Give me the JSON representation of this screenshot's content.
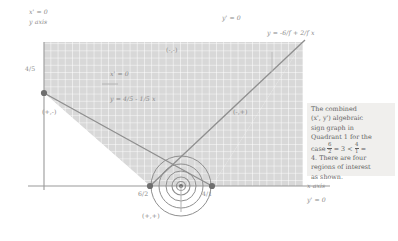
{
  "figure": {
    "type": "sign-graph",
    "description": "Algebraic sign graph in Quadrant 1",
    "axes": {
      "y_axis_label": "y axis",
      "x_axis_label": "x axis",
      "x_prime_zero": "x' = 0",
      "y_prime_zero_top": "y' = 0",
      "y_prime_zero_bottom": "y' = 0"
    },
    "curve_labels": {
      "x_prime_inner": "x' = 0",
      "line_one": "y = 4/5 - 1/5 x",
      "line_two": "y = -6/f + 2/f x"
    },
    "ticks": {
      "y_intercept": "4/5",
      "x_tick_left": "6/2",
      "x_tick_right": "4/1"
    },
    "regions": [
      {
        "name": "upper",
        "label": "(-,-)"
      },
      {
        "name": "left",
        "label": "(+,-)"
      },
      {
        "name": "right",
        "label": "(-,+)"
      },
      {
        "name": "lower",
        "label": "(+,+)"
      }
    ],
    "caption": {
      "line1": "The combined",
      "line2_a": "(x', y') algebraic",
      "line3": "sign graph in",
      "line4": "Quadrant 1 for the",
      "line5_pre": "case ",
      "case_frac1_num": "6",
      "case_frac1_den": "2",
      "line5_mid": " = 3 < ",
      "case_frac2_num": "4",
      "case_frac2_den": "1",
      "line5_post": " =",
      "line6": "4. There are four",
      "line7": "regions of interest",
      "line8": "as shown."
    },
    "colors": {
      "grid": "#cfcfcf",
      "shade": "#d6d6d6",
      "line": "#8f8f8f",
      "dot": "#7a7a7a",
      "text": "#8a8a8a",
      "caption_bg": "#f0efed"
    }
  }
}
